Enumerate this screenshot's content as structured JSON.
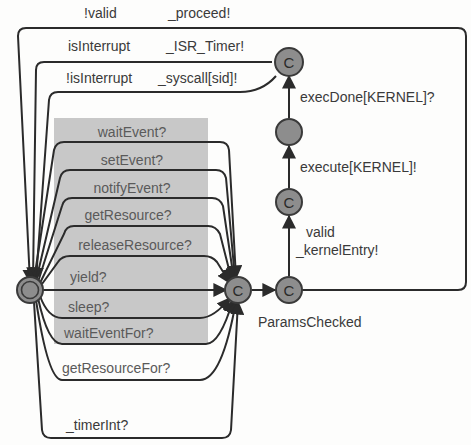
{
  "diagram": {
    "type": "timed-automaton",
    "colors": {
      "state_fill": "#8d8d8d",
      "state_stroke": "#3a3a3a",
      "edge": "#2b2b2b",
      "highlight_region": "#c8c8c8",
      "text": "#3a3a3a"
    },
    "states": [
      {
        "id": "init",
        "label": "",
        "kind": "initial"
      },
      {
        "id": "hub",
        "label": "C",
        "kind": "committed"
      },
      {
        "id": "params",
        "label": "C",
        "kind": "committed",
        "name": "ParamsChecked"
      },
      {
        "id": "entered",
        "label": "C",
        "kind": "committed"
      },
      {
        "id": "executing",
        "label": "",
        "kind": "normal"
      },
      {
        "id": "done",
        "label": "C",
        "kind": "committed"
      }
    ],
    "names": {
      "params_checked": "ParamsChecked"
    },
    "top_edges": {
      "proceed": {
        "guard": "!valid",
        "sync": "_proceed!"
      },
      "isr": {
        "guard": "isInterrupt",
        "sync": "_ISR_Timer!"
      },
      "syscall": {
        "guard": "!isInterrupt",
        "sync": "_syscall[sid]!"
      }
    },
    "service_edges": [
      "waitEvent?",
      "setEvent?",
      "notifyEvent?",
      "getResource?",
      "releaseResource?",
      "yield?",
      "sleep?",
      "waitEventFor?",
      "getResourceFor?"
    ],
    "right_edges": {
      "kernel_entry": {
        "guard": "valid",
        "sync": "_kernelEntry!"
      },
      "execute": "execute[KERNEL]!",
      "exec_done": "execDone[KERNEL]?"
    },
    "bottom_edge": {
      "sync": "_timerInt?"
    }
  }
}
